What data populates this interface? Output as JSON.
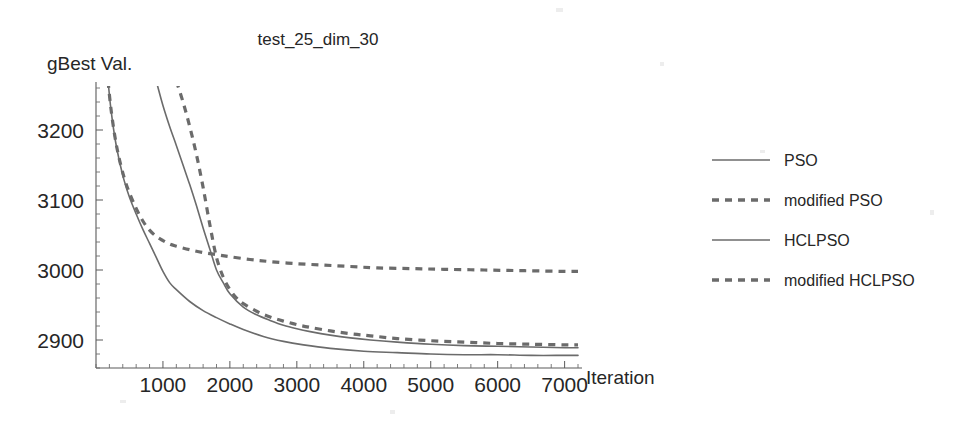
{
  "chart_data": {
    "type": "line",
    "title": "test_25_dim_30",
    "xlabel": "Iteration",
    "ylabel": "gBest Val.",
    "xlim": [
      0,
      7200
    ],
    "ylim": [
      2860,
      3260
    ],
    "xticks": [
      1000,
      2000,
      3000,
      4000,
      5000,
      6000,
      7000
    ],
    "xticklabels": [
      "1000",
      "2000",
      "3000",
      "4000",
      "5000",
      "6000",
      "7000"
    ],
    "yticks": [
      2900,
      3000,
      3100,
      3200
    ],
    "yticklabels": [
      "2900",
      "3000",
      "3100",
      "3200"
    ],
    "grid": false,
    "legend_position": "right",
    "series": [
      {
        "name": "PSO",
        "style": "solid",
        "color": "#6b6b6b",
        "x": [
          900,
          1000,
          1100,
          1200,
          1300,
          1400,
          1500,
          1600,
          1700,
          1800,
          1900,
          2000,
          2200,
          2400,
          2600,
          2800,
          3000,
          3200,
          3500,
          3800,
          4100,
          4500,
          5000,
          5500,
          6000,
          6500,
          7000,
          7200
        ],
        "y": [
          3270,
          3235,
          3205,
          3178,
          3150,
          3122,
          3092,
          3060,
          3030,
          3000,
          2982,
          2966,
          2947,
          2936,
          2928,
          2921,
          2916,
          2912,
          2907,
          2903,
          2900,
          2897,
          2894,
          2892,
          2891,
          2890,
          2889,
          2889
        ]
      },
      {
        "name": "modified PSO",
        "style": "dashed",
        "color": "#6b6b6b",
        "x": [
          1200,
          1300,
          1400,
          1500,
          1600,
          1700,
          1800,
          1900,
          2000,
          2100,
          2200,
          2400,
          2600,
          2800,
          3000,
          3200,
          3500,
          3800,
          4100,
          4500,
          5000,
          5500,
          6000,
          6500,
          7000,
          7200
        ],
        "y": [
          3270,
          3240,
          3205,
          3165,
          3118,
          3065,
          3018,
          2990,
          2972,
          2960,
          2952,
          2941,
          2933,
          2927,
          2922,
          2918,
          2913,
          2909,
          2906,
          2902,
          2899,
          2897,
          2895,
          2894,
          2893,
          2893
        ]
      },
      {
        "name": "HCLPSO",
        "style": "solid",
        "color": "#6b6b6b",
        "x": [
          180,
          220,
          280,
          340,
          420,
          500,
          600,
          700,
          800,
          900,
          1000,
          1100,
          1200,
          1400,
          1600,
          1800,
          2000,
          2200,
          2500,
          2800,
          3100,
          3500,
          4000,
          4500,
          5000,
          5500,
          6000,
          6500,
          7000,
          7200
        ],
        "y": [
          3270,
          3232,
          3190,
          3160,
          3128,
          3104,
          3080,
          3058,
          3038,
          3018,
          2998,
          2982,
          2972,
          2955,
          2942,
          2932,
          2923,
          2915,
          2905,
          2898,
          2893,
          2888,
          2884,
          2882,
          2880,
          2879,
          2879,
          2878,
          2878,
          2878
        ]
      },
      {
        "name": "modified HCLPSO",
        "style": "dashed",
        "color": "#6b6b6b",
        "x": [
          180,
          220,
          280,
          340,
          420,
          500,
          600,
          700,
          800,
          900,
          1000,
          1100,
          1200,
          1400,
          1600,
          1800,
          2000,
          2300,
          2600,
          3000,
          3400,
          3800,
          4200,
          4700,
          5200,
          5800,
          6400,
          7000,
          7200
        ],
        "y": [
          3270,
          3233,
          3192,
          3162,
          3132,
          3110,
          3088,
          3070,
          3057,
          3048,
          3042,
          3037,
          3034,
          3029,
          3025,
          3022,
          3019,
          3015,
          3012,
          3009,
          3007,
          3005,
          3003,
          3002,
          3001,
          3000,
          2999,
          2998,
          2998
        ]
      }
    ],
    "legend": [
      {
        "label": "PSO",
        "style": "solid"
      },
      {
        "label": "modified PSO",
        "style": "dashed"
      },
      {
        "label": "HCLPSO",
        "style": "solid"
      },
      {
        "label": "modified HCLPSO",
        "style": "dashed"
      }
    ]
  }
}
